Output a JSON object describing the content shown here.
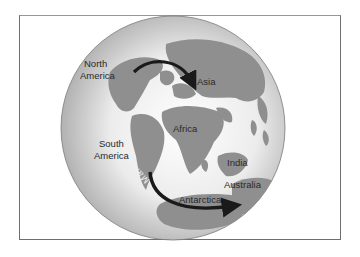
{
  "diagram": {
    "type": "globe-migration-map",
    "colors": {
      "frame": "#6e6e6e",
      "ocean_light": "#f4f4f4",
      "ocean_dark": "#a9a9a9",
      "land": "#8f8f8f",
      "arrow": "#1a1a1a",
      "label": "#2a2a2a",
      "rotated_label": "#f2f2f2"
    },
    "labels": {
      "north_america_line1": "North",
      "north_america_line2": "America",
      "asia": "Asia",
      "africa": "Africa",
      "south_america_line1": "South",
      "south_america_line2": "America",
      "india": "India",
      "australia": "Australia",
      "antarctica": "Antarctica",
      "migration_group": "Marsupialia"
    },
    "arrows": [
      {
        "name": "north-migration-arrow",
        "from": "North America",
        "to": "Asia"
      },
      {
        "name": "south-migration-arrow",
        "from": "South America",
        "to": "Australia",
        "via": "Antarctica"
      }
    ]
  }
}
